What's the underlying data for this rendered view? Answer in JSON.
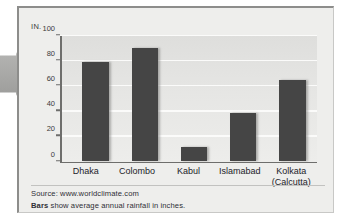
{
  "chart_data": {
    "type": "bar",
    "title": "",
    "subtitle": "",
    "xlabel": "",
    "ylabel": "IN.",
    "unit_label": "IN.",
    "categories": [
      "Dhaka",
      "Colombo",
      "Kabul",
      "Islamabad",
      "Kolkata (Calcutta)"
    ],
    "category_lines": [
      [
        "Dhaka"
      ],
      [
        "Colombo"
      ],
      [
        "Kabul"
      ],
      [
        "Islamabad"
      ],
      [
        "Kolkata",
        "(Calcutta)"
      ]
    ],
    "values": [
      79,
      90,
      11,
      38,
      65
    ],
    "ylim": [
      0,
      100
    ],
    "yticks": [
      0,
      20,
      40,
      60,
      80,
      100
    ],
    "ytick_labels": [
      "0",
      "20",
      "40",
      "60",
      "80",
      "100"
    ],
    "grid": true,
    "legend": "none",
    "bar_color": "#454545",
    "plot_background": "#e6e6e4",
    "gridline_color": "#fbfbfa",
    "axis_color": "#6e6e6c"
  },
  "footer": {
    "source": "Source: www.worldclimate.com",
    "note_bold": "Bars",
    "note_rest": " show average annual rainfall in inches."
  },
  "decorations": {
    "arrow_color": "#a5a5a3",
    "panel_background": "#eeeeec",
    "frame_color": "#8d8d8b"
  }
}
